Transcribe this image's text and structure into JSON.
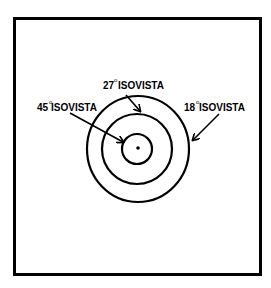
{
  "diagram": {
    "type": "concentric isovista diagram",
    "labels": [
      {
        "id": "iso45",
        "angle": "45",
        "degree": "o",
        "text": "ISOVISTA"
      },
      {
        "id": "iso27",
        "angle": "27",
        "degree": "o",
        "text": "ISOVISTA"
      },
      {
        "id": "iso18",
        "angle": "18",
        "degree": "o",
        "text": " ISOVISTA"
      }
    ],
    "circles": [
      {
        "name": "18-degree-isovista",
        "rx": 51,
        "ry": 55
      },
      {
        "name": "27-degree-isovista",
        "r": 35
      },
      {
        "name": "45-degree-isovista",
        "r": 15
      }
    ],
    "colors": {
      "stroke": "#000000",
      "background": "#ffffff"
    }
  }
}
